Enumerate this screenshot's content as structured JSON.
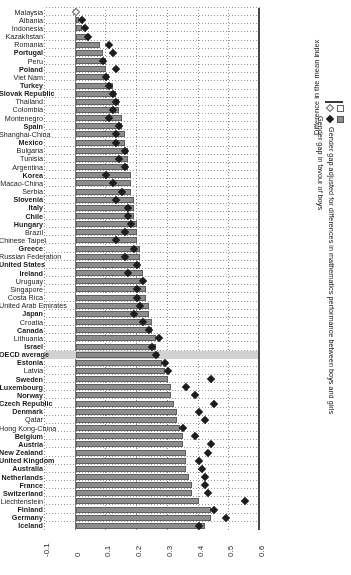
{
  "chart_data": {
    "type": "bar",
    "title": "",
    "xlabel": "",
    "ylabel": "Difference in the mean index",
    "axis_title": "Difference in the mean index",
    "orientation": "horizontal",
    "xlim": [
      -0.1,
      0.6
    ],
    "tick_labels": [
      "0.6",
      "0.5",
      "0.4",
      "0.3",
      "0.2",
      "0.1",
      "0",
      "-0.1"
    ],
    "tick_values": [
      0.6,
      0.5,
      0.4,
      0.3,
      0.2,
      0.1,
      0,
      -0.1
    ],
    "grid": true,
    "legend_position": "left",
    "legend": [
      {
        "label": "Gender gap adjusted for differences in mathematics performance between boys and girls",
        "bar_color": "#8d8d8d",
        "marker_color": "#1b1b1b",
        "marker": "diamond-filled"
      },
      {
        "label": "Gender gap in favour of boys",
        "bar_color": "#ffffff",
        "marker_color": "#f3f3f3",
        "marker": "diamond-open"
      }
    ],
    "series": [
      {
        "name": "Gender gap adjusted for differences in mathematics performance between boys and girls",
        "kind": "bar"
      },
      {
        "name": "Gender gap in favour of boys",
        "kind": "diamond"
      }
    ],
    "categories": [
      "Iceland",
      "Germany",
      "Finland",
      "Liechtenstein",
      "Switzerland",
      "France",
      "Netherlands",
      "Australia",
      "United Kingdom",
      "New Zealand",
      "Austria",
      "Belgium",
      "Hong Kong-China",
      "Qatar",
      "Denmark",
      "Czech Republic",
      "Norway",
      "Luxembourg",
      "Sweden",
      "Latvia",
      "Estonia",
      "OECD average",
      "Israel",
      "Lithuania",
      "Canada",
      "Croatia",
      "Japan",
      "United Arab Emirates",
      "Costa Rica",
      "Singapore",
      "Uruguay",
      "Ireland",
      "United States",
      "Russian Federation",
      "Greece",
      "Chinese Taipei",
      "Brazil",
      "Hungary",
      "Chile",
      "Italy",
      "Slovenia",
      "Serbia",
      "Macao-China",
      "Korea",
      "Argentina",
      "Tunisia",
      "Bulgaria",
      "Mexico",
      "Shanghai-China",
      "Spain",
      "Montenegro",
      "Colombia",
      "Thailand",
      "Slovak Republic",
      "Turkey",
      "Viet Nam",
      "Poland",
      "Peru",
      "Portugal",
      "Romania",
      "Kazakhstan",
      "Indonesia",
      "Albania",
      "Malaysia"
    ],
    "bar_values": [
      0.42,
      0.44,
      0.44,
      0.4,
      0.38,
      0.38,
      0.37,
      0.36,
      0.36,
      0.36,
      0.35,
      0.35,
      0.34,
      0.33,
      0.33,
      0.32,
      0.31,
      0.31,
      0.3,
      0.29,
      0.28,
      0.27,
      0.26,
      0.26,
      0.25,
      0.25,
      0.24,
      0.24,
      0.23,
      0.23,
      0.22,
      0.22,
      0.21,
      0.21,
      0.21,
      0.2,
      0.2,
      0.2,
      0.19,
      0.19,
      0.19,
      0.18,
      0.18,
      0.18,
      0.17,
      0.17,
      0.17,
      0.16,
      0.16,
      0.15,
      0.15,
      0.14,
      0.14,
      0.13,
      0.12,
      0.11,
      0.1,
      0.1,
      0.09,
      0.08,
      0.04,
      0.02,
      0.01,
      -0.01
    ],
    "diamond_values": [
      0.4,
      0.49,
      0.45,
      0.55,
      0.43,
      0.42,
      0.42,
      0.41,
      0.4,
      0.43,
      0.44,
      0.39,
      0.35,
      0.42,
      0.4,
      0.45,
      0.39,
      0.36,
      0.44,
      0.3,
      0.29,
      0.26,
      0.25,
      0.27,
      0.24,
      0.22,
      0.19,
      0.21,
      0.2,
      0.2,
      0.22,
      0.17,
      0.2,
      0.16,
      0.19,
      0.13,
      0.16,
      0.18,
      0.17,
      0.17,
      0.13,
      0.15,
      0.12,
      0.1,
      0.16,
      0.14,
      0.16,
      0.13,
      0.13,
      0.14,
      0.11,
      0.12,
      0.13,
      0.12,
      0.11,
      0.1,
      0.13,
      0.09,
      0.12,
      0.11,
      0.04,
      0.03,
      0.02,
      0.0
    ],
    "negative_rows": [
      "Kazakhstan",
      "Indonesia",
      "Albania",
      "Malaysia"
    ],
    "highlight_row": "OECD average",
    "bold_rows": [
      "Hungary",
      "Chile",
      "Italy",
      "Slovenia",
      "Korea",
      "Mexico",
      "Spain",
      "Slovak Republic",
      "Turkey",
      "Poland",
      "Portugal",
      "Germany",
      "Finland",
      "Iceland",
      "Switzerland",
      "France",
      "Netherlands",
      "Australia",
      "United Kingdom",
      "New Zealand",
      "Austria",
      "Belgium",
      "Denmark",
      "Czech Republic",
      "Norway",
      "Luxembourg",
      "Sweden",
      "Estonia",
      "Israel",
      "Canada",
      "Japan",
      "Ireland",
      "United States",
      "Greece",
      "OECD average"
    ]
  }
}
